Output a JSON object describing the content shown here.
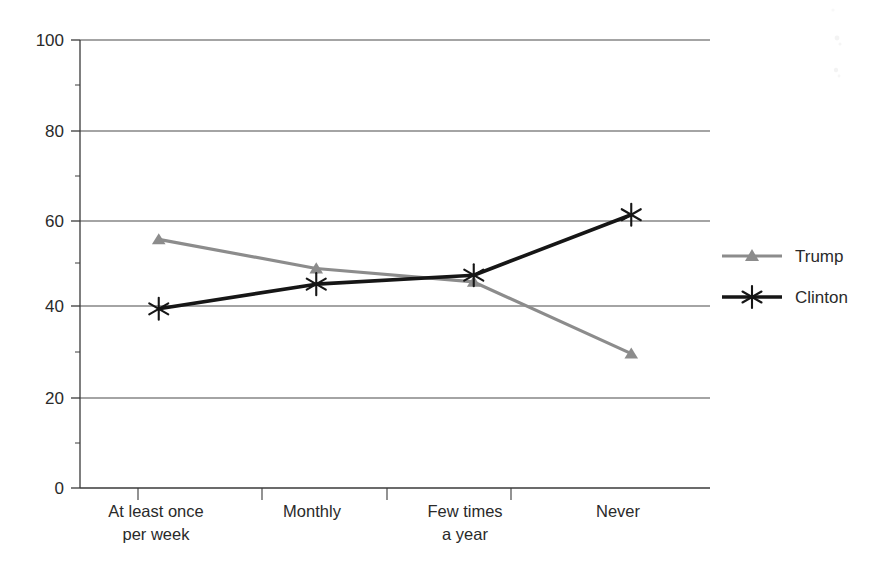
{
  "chart_data": {
    "type": "line",
    "title": "",
    "subtitle": "",
    "xlabel": "",
    "ylabel": "",
    "categories": [
      "At least once|per week",
      "Monthly",
      "Few times|a year",
      "Never"
    ],
    "category_lines": [
      [
        "At least once",
        "per week"
      ],
      [
        "Monthly",
        ""
      ],
      [
        "Few times",
        "a year"
      ],
      [
        "Never",
        ""
      ]
    ],
    "series": [
      {
        "name": "Trump",
        "values": [
          55.5,
          49,
          46,
          30
        ],
        "color": "#8c8c8c",
        "marker": "triangle"
      },
      {
        "name": "Clinton",
        "values": [
          40,
          45.5,
          47.5,
          61
        ],
        "color": "#161616",
        "marker": "asterisk"
      }
    ],
    "ylim": [
      0,
      100
    ],
    "ytick_values": [
      0,
      20,
      40,
      60,
      80,
      100
    ],
    "ytick_labels": [
      "0",
      "20",
      "40",
      "60",
      "80",
      "100"
    ],
    "yminor_values": [
      10,
      30,
      50,
      70,
      90
    ],
    "grid": true,
    "grid_axis": "y",
    "legend_position": "right",
    "legend_entries": [
      "Trump",
      "Clinton"
    ]
  },
  "axis": {
    "y_labels": {
      "v100": "100",
      "v80": "80",
      "v60": "60",
      "v40": "40",
      "v20": "20",
      "v0": "0"
    },
    "x_labels": {
      "c0_line1": "At least once",
      "c0_line2": "per week",
      "c1_line1": "Monthly",
      "c2_line1": "Few times",
      "c2_line2": "a year",
      "c3_line1": "Never"
    }
  },
  "legend": {
    "items": [
      {
        "label": "Trump",
        "color": "#8c8c8c",
        "marker": "triangle-marker"
      },
      {
        "label": "Clinton",
        "color": "#161616",
        "marker": "asterisk-marker"
      }
    ]
  },
  "colors": {
    "trump": "#8c8c8c",
    "clinton": "#161616",
    "axis": "#3a3a3a",
    "grid": "#4a4a4a",
    "background": "#ffffff"
  }
}
